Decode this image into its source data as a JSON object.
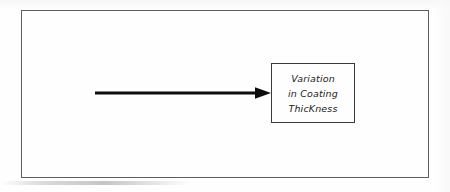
{
  "figure": {
    "type": "hand-drawn-block-diagram",
    "frame": {
      "label": "outer-frame"
    },
    "arrow": {
      "direction": "right",
      "style": "solid-thick-line-with-filled-triangular-head",
      "color": "#0d0d0d"
    },
    "label_box": {
      "border_color": "#3a3a3a",
      "text_lines": [
        "Variation",
        "in Coating",
        "ThicKness"
      ],
      "full_text": "Variation in Coating ThicKness"
    }
  }
}
